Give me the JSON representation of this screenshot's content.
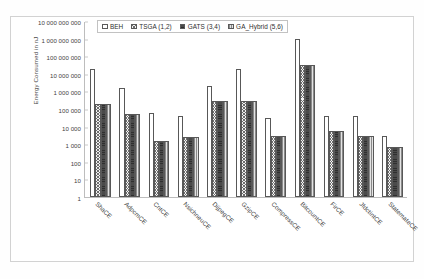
{
  "chart_data": {
    "type": "bar",
    "title": "",
    "xlabel": "",
    "ylabel": "Energy Consumed in nJ",
    "yscale": "log",
    "ylim": [
      1,
      10000000000
    ],
    "ytick_labels": [
      "10 000 000 000",
      "1 000 000 000",
      "100 000 000",
      "10 000 000",
      "1 000 000",
      "100 000",
      "10 000",
      "1 000",
      "100",
      "10",
      "1"
    ],
    "ytick_values": [
      10000000000,
      1000000000,
      100000000,
      10000000,
      1000000,
      100000,
      10000,
      1000,
      100,
      10,
      1
    ],
    "grid": false,
    "legend_position": "top-left-inside",
    "categories": [
      "ShaCE",
      "AdpcmCE",
      "CntCE",
      "NsichneuCE",
      "DijpegCE",
      "GzipCE",
      "CompressCE",
      "BitcountCE",
      "FirCE",
      "JfdctintCE",
      "StatemateCE"
    ],
    "series": [
      {
        "name": "BEH",
        "values": [
          20000000,
          1500000,
          60000,
          40000,
          2000000,
          20000000,
          30000,
          1000000000,
          40000,
          40000,
          3000
        ]
      },
      {
        "name": "TSGA (1,2)",
        "values": [
          200000,
          50000,
          1500,
          2500,
          300000,
          300000,
          3000,
          30000000,
          6000,
          3000,
          700
        ]
      },
      {
        "name": "GATS (3,4)",
        "values": [
          200000,
          50000,
          1500,
          2500,
          300000,
          300000,
          3000,
          30000000,
          6000,
          3000,
          700
        ]
      },
      {
        "name": "GA_Hybrid (5,6)",
        "values": [
          200000,
          50000,
          1500,
          2500,
          300000,
          300000,
          3000,
          30000000,
          6000,
          3000,
          700
        ]
      }
    ]
  },
  "legend": {
    "items": [
      {
        "label": "BEH"
      },
      {
        "label": "TSGA (1,2)"
      },
      {
        "label": "GATS (3,4)"
      },
      {
        "label": "GA_Hybrid (5,6)"
      }
    ]
  }
}
